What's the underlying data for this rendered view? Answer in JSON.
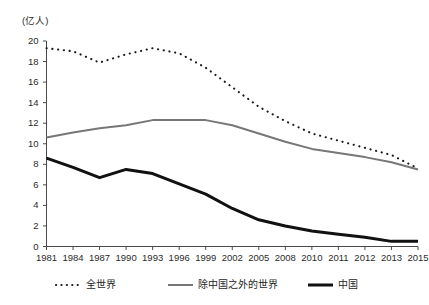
{
  "chart_data": {
    "type": "line",
    "title": "",
    "xlabel": "",
    "ylabel": "(亿人)",
    "yunit_label": "(亿人)",
    "categories": [
      "1981",
      "1984",
      "1987",
      "1990",
      "1993",
      "1996",
      "1999",
      "2002",
      "2005",
      "2008",
      "2010",
      "2011",
      "2012",
      "2013",
      "2015"
    ],
    "ylim": [
      0,
      20
    ],
    "ytick_step": 2,
    "yticks": [
      "0",
      "2",
      "4",
      "6",
      "8",
      "10",
      "12",
      "14",
      "16",
      "18",
      "20"
    ],
    "grid": false,
    "legend_position": "bottom",
    "series": [
      {
        "name": "全世界",
        "style": "dotted",
        "color": "#1c1c1c",
        "values": [
          19.3,
          19.0,
          17.9,
          18.7,
          19.3,
          18.8,
          17.4,
          15.5,
          13.6,
          12.2,
          11.0,
          10.3,
          9.6,
          8.9,
          7.6
        ]
      },
      {
        "name": "除中国之外的世界",
        "style": "solid-gray",
        "color": "#777777",
        "values": [
          10.6,
          11.1,
          11.5,
          11.8,
          12.3,
          12.3,
          12.3,
          11.8,
          11.0,
          10.2,
          9.5,
          9.1,
          8.7,
          8.2,
          7.5
        ]
      },
      {
        "name": "中国",
        "style": "solid-black",
        "color": "#111111",
        "values": [
          8.6,
          7.7,
          6.7,
          7.5,
          7.1,
          6.1,
          5.1,
          3.7,
          2.6,
          2.0,
          1.5,
          1.2,
          0.9,
          0.5,
          0.5
        ]
      }
    ]
  },
  "legend": {
    "items": [
      {
        "label": "全世界",
        "style": "dotted"
      },
      {
        "label": "除中国之外的世界",
        "style": "solid-gray"
      },
      {
        "label": "中国",
        "style": "solid-black"
      }
    ]
  }
}
